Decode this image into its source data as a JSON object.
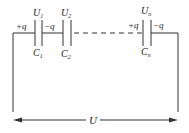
{
  "diagram": {
    "capacitors": [
      {
        "name": "C1",
        "voltage": "U1",
        "plus": "+q",
        "minus": "-q"
      },
      {
        "name": "C2",
        "voltage": "U2"
      },
      {
        "name": "Cn",
        "voltage": "Un",
        "plus": "+q",
        "minus": "-q"
      }
    ],
    "labels": {
      "u1": "U",
      "u1_sub": "1",
      "u2": "U",
      "u2_sub": "2",
      "un": "U",
      "un_sub": "n",
      "c1": "C",
      "c1_sub": "1",
      "c2": "C",
      "c2_sub": "2",
      "cn": "C",
      "cn_sub": "n",
      "plus_q_1": "+q",
      "minus_q_1": "−q",
      "plus_q_n": "+q",
      "minus_q_n": "−q",
      "total_voltage": "U"
    },
    "stroke_color": "#333333"
  }
}
